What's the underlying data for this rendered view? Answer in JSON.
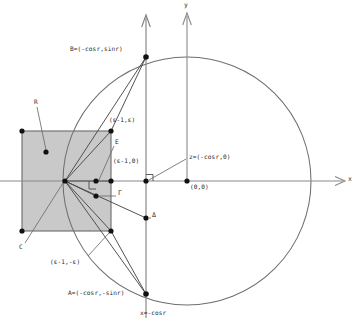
{
  "figure": {
    "type": "geometry-diagram",
    "width": 358,
    "height": 331,
    "background": "#ffffff",
    "colors": {
      "square_fill": "#c9c9c9",
      "square_stroke": "#6a6a6a",
      "axis": "#8a8a8a",
      "circle": "#6f6f6f",
      "ray": "#4a4a4a",
      "point": "#111111",
      "text": "#2a2a2a"
    }
  },
  "axes": {
    "x_label": "x",
    "y_label": "y",
    "origin_label": "(0,0)",
    "vertical_line_label": "x=-cosr"
  },
  "labels": {
    "B": "B=(-cosr,sinr)",
    "A": "A=(-cosr,-sinr)",
    "z": "z=(-cosr,0)",
    "origin": "(0,0)",
    "eps_top": "(ε-1,ε)",
    "eps_mid": "(ε-1,0)",
    "eps_bot": "(ε-1,-ε)",
    "R": "R",
    "C": "C",
    "E": "E",
    "Gamma": "Γ",
    "Delta": "Δ",
    "x_axis": "x",
    "y_axis": "y",
    "vline": "x=-cosr"
  },
  "points": [
    {
      "name": "square-top-left",
      "x": 22,
      "y": 131
    },
    {
      "name": "square-top-right",
      "x": 111,
      "y": 131
    },
    {
      "name": "square-bottom-left",
      "x": 22,
      "y": 231
    },
    {
      "name": "square-bottom-right",
      "x": 111,
      "y": 231
    },
    {
      "name": "R-dot",
      "x": 46,
      "y": 152
    },
    {
      "name": "vertex-hub",
      "x": 65,
      "y": 181
    },
    {
      "name": "E-dot",
      "x": 96,
      "y": 181
    },
    {
      "name": "Gamma-dot",
      "x": 96,
      "y": 196
    },
    {
      "name": "Delta-dot",
      "x": 146,
      "y": 218
    },
    {
      "name": "eps-mid-dot",
      "x": 111,
      "y": 181
    },
    {
      "name": "z-dot",
      "x": 146,
      "y": 181
    },
    {
      "name": "origin-dot",
      "x": 187,
      "y": 181
    },
    {
      "name": "B-dot",
      "x": 146,
      "y": 57
    },
    {
      "name": "A-dot",
      "x": 146,
      "y": 294
    }
  ],
  "geometry": {
    "circle": {
      "cx": 187,
      "cy": 181,
      "r": 124
    },
    "square": {
      "x": 22,
      "y": 131,
      "w": 89,
      "h": 100
    },
    "x_axis": {
      "x1": 0,
      "y1": 181,
      "x2": 345,
      "y2": 181
    },
    "y_axis": {
      "x": 187,
      "y_top": 12,
      "y_bottom": 181
    },
    "v_line": {
      "x": 146,
      "y_top": 14,
      "y_bottom": 318
    }
  },
  "rays": [
    {
      "name": "hub-to-B",
      "x1": 65,
      "y1": 181,
      "x2": 146,
      "y2": 57
    },
    {
      "name": "hub-to-A",
      "x1": 65,
      "y1": 181,
      "x2": 146,
      "y2": 294
    },
    {
      "name": "hub-to-eps-top",
      "x1": 65,
      "y1": 181,
      "x2": 111,
      "y2": 131
    },
    {
      "name": "hub-to-eps-bot",
      "x1": 65,
      "y1": 181,
      "x2": 111,
      "y2": 231
    },
    {
      "name": "hub-to-E",
      "x1": 65,
      "y1": 181,
      "x2": 96,
      "y2": 181
    },
    {
      "name": "hub-to-Gamma",
      "x1": 65,
      "y1": 181,
      "x2": 96,
      "y2": 196
    },
    {
      "name": "hub-to-Delta",
      "x1": 65,
      "y1": 181,
      "x2": 146,
      "y2": 218
    },
    {
      "name": "hub-to-eps-mid",
      "x1": 65,
      "y1": 181,
      "x2": 111,
      "y2": 181
    },
    {
      "name": "chord-B-to-sqTR",
      "x1": 146,
      "y1": 57,
      "x2": 111,
      "y2": 131
    },
    {
      "name": "chord-A-to-sqBR",
      "x1": 146,
      "y1": 294,
      "x2": 111,
      "y2": 231
    }
  ],
  "leaders": [
    {
      "name": "leader-R",
      "x1": 37,
      "y1": 107,
      "x2": 46,
      "y2": 150
    },
    {
      "name": "leader-C",
      "x1": 25,
      "y1": 243,
      "x2": 63,
      "y2": 183
    },
    {
      "name": "leader-E",
      "x1": 114,
      "y1": 146,
      "x2": 98,
      "y2": 182
    },
    {
      "name": "leader-Gamma",
      "x1": 117,
      "y1": 196,
      "x2": 98,
      "y2": 196
    },
    {
      "name": "leader-Delta",
      "x1": 151,
      "y1": 218,
      "x2": 148,
      "y2": 218
    },
    {
      "name": "leader-z",
      "x1": 186,
      "y1": 158,
      "x2": 148,
      "y2": 180
    },
    {
      "name": "leader-epsbot",
      "x1": 88,
      "y1": 258,
      "x2": 109,
      "y2": 233
    }
  ],
  "text_positions": [
    {
      "key": "B",
      "x": 70,
      "y": 46,
      "anchor": "left"
    },
    {
      "key": "A",
      "x": 68,
      "y": 290,
      "anchor": "left"
    },
    {
      "key": "z",
      "x": 189,
      "y": 155,
      "anchor": "left"
    },
    {
      "key": "origin",
      "x": 190,
      "y": 184,
      "anchor": "left"
    },
    {
      "key": "eps_top",
      "x": 109,
      "y": 118,
      "anchor": "left"
    },
    {
      "key": "eps_mid",
      "x": 113,
      "y": 159,
      "anchor": "left"
    },
    {
      "key": "eps_bot",
      "x": 50,
      "y": 260,
      "anchor": "left"
    },
    {
      "key": "R",
      "x": 34,
      "y": 100,
      "anchor": "left"
    },
    {
      "key": "C",
      "x": 19,
      "y": 244,
      "anchor": "left"
    },
    {
      "key": "E",
      "x": 115,
      "y": 140,
      "anchor": "left"
    },
    {
      "key": "Gamma",
      "x": 118,
      "y": 191,
      "anchor": "left"
    },
    {
      "key": "Delta",
      "x": 152,
      "y": 213,
      "anchor": "left"
    },
    {
      "key": "x_axis",
      "x": 348,
      "y": 177,
      "anchor": "left"
    },
    {
      "key": "y_axis",
      "x": 185,
      "y": 3,
      "anchor": "left"
    },
    {
      "key": "vline",
      "x": 140,
      "y": 310,
      "anchor": "left"
    }
  ]
}
